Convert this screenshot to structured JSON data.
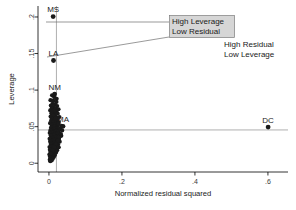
{
  "chart_data": {
    "type": "scatter",
    "title": "",
    "xlabel": "Normalized residual squared",
    "ylabel": "Leverage",
    "xlim": [
      -0.03,
      0.655
    ],
    "ylim": [
      -0.012,
      0.215
    ],
    "xticks": [
      0,
      0.2,
      0.4,
      0.6
    ],
    "xticklabels": [
      "0",
      ".2",
      ".4",
      ".6"
    ],
    "yticks": [
      0,
      0.05,
      0.1,
      0.15,
      0.2
    ],
    "yticklabels": [
      "0",
      ".05",
      ".1",
      ".15",
      ".2"
    ],
    "grid": false,
    "legend": "none",
    "reference_lines": [
      {
        "name": "mean-leverage-line",
        "orientation": "horizontal",
        "value": 0.0455
      },
      {
        "name": "mean-residual-line",
        "orientation": "vertical",
        "value": 0.0205
      }
    ],
    "labeled_points": [
      {
        "label": "MS",
        "x": 0.0115,
        "y": 0.2005
      },
      {
        "label": "LA",
        "x": 0.0125,
        "y": 0.1405
      },
      {
        "label": "NM",
        "x": 0.0155,
        "y": 0.0945
      },
      {
        "label": "MA",
        "x": 0.0385,
        "y": 0.0505
      },
      {
        "label": "DC",
        "x": 0.6005,
        "y": 0.0495
      }
    ],
    "cluster_points": [
      [
        0.0042,
        0.0862
      ],
      [
        0.0118,
        0.0855
      ],
      [
        0.0205,
        0.0838
      ],
      [
        0.0098,
        0.0812
      ],
      [
        0.0162,
        0.0805
      ],
      [
        0.0052,
        0.0788
      ],
      [
        0.0225,
        0.0782
      ],
      [
        0.0135,
        0.0768
      ],
      [
        0.0078,
        0.0752
      ],
      [
        0.0188,
        0.0745
      ],
      [
        0.0262,
        0.0738
      ],
      [
        0.0035,
        0.0722
      ],
      [
        0.0112,
        0.0715
      ],
      [
        0.0205,
        0.0708
      ],
      [
        0.0148,
        0.0695
      ],
      [
        0.0068,
        0.0685
      ],
      [
        0.0242,
        0.0678
      ],
      [
        0.0095,
        0.0668
      ],
      [
        0.0175,
        0.0658
      ],
      [
        0.0128,
        0.0648
      ],
      [
        0.0045,
        0.0638
      ],
      [
        0.0288,
        0.0632
      ],
      [
        0.0205,
        0.0625
      ],
      [
        0.0158,
        0.0615
      ],
      [
        0.0082,
        0.0608
      ],
      [
        0.0118,
        0.0598
      ],
      [
        0.0238,
        0.0592
      ],
      [
        0.0062,
        0.0585
      ],
      [
        0.0188,
        0.0578
      ],
      [
        0.0142,
        0.0568
      ],
      [
        0.0098,
        0.0562
      ],
      [
        0.0268,
        0.0555
      ],
      [
        0.0032,
        0.0548
      ],
      [
        0.0212,
        0.0542
      ],
      [
        0.0165,
        0.0535
      ],
      [
        0.0122,
        0.0528
      ],
      [
        0.0075,
        0.0522
      ],
      [
        0.0245,
        0.0515
      ],
      [
        0.0192,
        0.0508
      ],
      [
        0.0148,
        0.0502
      ],
      [
        0.0105,
        0.0495
      ],
      [
        0.0058,
        0.0488
      ],
      [
        0.0315,
        0.0482
      ],
      [
        0.0225,
        0.0478
      ],
      [
        0.0172,
        0.0472
      ],
      [
        0.0132,
        0.0465
      ],
      [
        0.0088,
        0.0458
      ],
      [
        0.0042,
        0.0452
      ],
      [
        0.0262,
        0.0448
      ],
      [
        0.0205,
        0.0442
      ],
      [
        0.0155,
        0.0435
      ],
      [
        0.0112,
        0.0428
      ],
      [
        0.0068,
        0.0422
      ],
      [
        0.0022,
        0.0415
      ],
      [
        0.0288,
        0.0412
      ],
      [
        0.0232,
        0.0405
      ],
      [
        0.0182,
        0.0398
      ],
      [
        0.0138,
        0.0392
      ],
      [
        0.0095,
        0.0385
      ],
      [
        0.0048,
        0.0378
      ],
      [
        0.0338,
        0.0375
      ],
      [
        0.0255,
        0.0368
      ],
      [
        0.0198,
        0.0362
      ],
      [
        0.0152,
        0.0355
      ],
      [
        0.0108,
        0.0348
      ],
      [
        0.0062,
        0.0342
      ],
      [
        0.0018,
        0.0335
      ],
      [
        0.0275,
        0.0332
      ],
      [
        0.0218,
        0.0325
      ],
      [
        0.0168,
        0.0318
      ],
      [
        0.0122,
        0.0312
      ],
      [
        0.0078,
        0.0305
      ],
      [
        0.0032,
        0.0298
      ],
      [
        0.0295,
        0.0295
      ],
      [
        0.0238,
        0.0288
      ],
      [
        0.0185,
        0.0282
      ],
      [
        0.0138,
        0.0275
      ],
      [
        0.0092,
        0.0268
      ],
      [
        0.0048,
        0.0262
      ],
      [
        0.0252,
        0.0255
      ],
      [
        0.0198,
        0.0248
      ],
      [
        0.0148,
        0.0242
      ],
      [
        0.0102,
        0.0235
      ],
      [
        0.0058,
        0.0228
      ],
      [
        0.0015,
        0.0222
      ],
      [
        0.0268,
        0.0218
      ],
      [
        0.0212,
        0.0212
      ],
      [
        0.0162,
        0.0205
      ],
      [
        0.0115,
        0.0198
      ],
      [
        0.0068,
        0.0192
      ],
      [
        0.0025,
        0.0185
      ],
      [
        0.0225,
        0.0178
      ],
      [
        0.0175,
        0.0172
      ],
      [
        0.0128,
        0.0165
      ],
      [
        0.0082,
        0.0158
      ],
      [
        0.0038,
        0.0152
      ],
      [
        0.0195,
        0.0145
      ],
      [
        0.0145,
        0.0138
      ],
      [
        0.0098,
        0.0132
      ],
      [
        0.0052,
        0.0125
      ],
      [
        0.0012,
        0.0118
      ],
      [
        0.0165,
        0.0112
      ],
      [
        0.0118,
        0.0105
      ],
      [
        0.0072,
        0.0098
      ],
      [
        0.0028,
        0.0092
      ],
      [
        0.0135,
        0.0085
      ],
      [
        0.0088,
        0.0078
      ],
      [
        0.0045,
        0.0072
      ],
      [
        0.0105,
        0.0062
      ],
      [
        0.0058,
        0.0055
      ],
      [
        0.0022,
        0.0048
      ],
      [
        0.0075,
        0.0038
      ],
      [
        0.0035,
        0.0028
      ],
      [
        0.0142,
        0.0905
      ],
      [
        0.0085,
        0.0928
      ],
      [
        0.0212,
        0.0882
      ],
      [
        0.0182,
        0.0612
      ],
      [
        0.0255,
        0.0538
      ],
      [
        0.0305,
        0.0465
      ],
      [
        0.0345,
        0.0512
      ],
      [
        0.0362,
        0.0448
      ],
      [
        0.0328,
        0.0398
      ],
      [
        0.0282,
        0.0352
      ],
      [
        0.0242,
        0.0308
      ],
      [
        0.0195,
        0.0262
      ],
      [
        0.0148,
        0.0218
      ],
      [
        0.0102,
        0.0175
      ],
      [
        0.0055,
        0.0132
      ]
    ]
  },
  "annotations": {
    "boxed": {
      "name": "high-leverage-low-residual-annotation",
      "line1": "High Leverage",
      "line2": "Low Residual"
    },
    "plain": {
      "name": "high-residual-low-leverage-annotation",
      "line1": "High Residual",
      "line2": "Low Leverage"
    }
  }
}
